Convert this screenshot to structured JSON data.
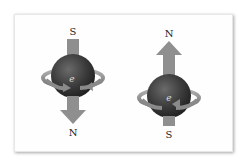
{
  "diagram": {
    "left_electron": {
      "top_pole": "S",
      "bottom_pole": "N",
      "label": "e",
      "arrow_direction": "down"
    },
    "right_electron": {
      "top_pole": "N",
      "bottom_pole": "S",
      "label": "e",
      "arrow_direction": "up"
    },
    "colors": {
      "arrow": "#8f8f8f",
      "sphere": "#3f3f3f",
      "ring": "#9a9a9a",
      "panel_bg": "#fefefe"
    }
  }
}
